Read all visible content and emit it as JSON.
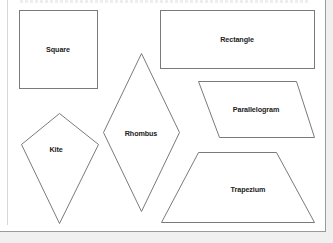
{
  "diagram": {
    "title": "",
    "shapes": [
      {
        "id": "square",
        "label": "Square",
        "type": "quadrilateral"
      },
      {
        "id": "rectangle",
        "label": "Rectangle",
        "type": "quadrilateral"
      },
      {
        "id": "parallelogram",
        "label": "Parallelogram",
        "type": "quadrilateral"
      },
      {
        "id": "rhombus",
        "label": "Rhombus",
        "type": "quadrilateral"
      },
      {
        "id": "kite",
        "label": "Kite",
        "type": "quadrilateral"
      },
      {
        "id": "trapezium",
        "label": "Trapezium",
        "type": "quadrilateral"
      }
    ]
  },
  "colors": {
    "stroke": "#7a7a7a",
    "label": "#222222",
    "page_bg": "#ffffff",
    "outer_bg": "#f0f0f0"
  }
}
